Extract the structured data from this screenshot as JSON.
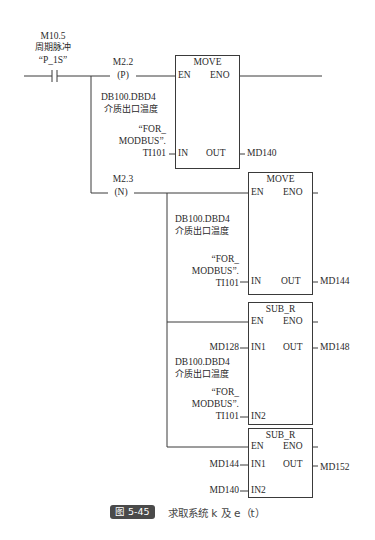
{
  "network": {
    "contact": {
      "address": "M10.5",
      "comment": "周期脉冲",
      "symbol": "“P_1S”",
      "type": "normally-open"
    },
    "coil_p": {
      "address": "M2.2",
      "label": "(P)"
    },
    "coil_n": {
      "address": "M2.3",
      "label": "(N)"
    },
    "move1": {
      "title": "MOVE",
      "en": "EN",
      "eno": "ENO",
      "in": "IN",
      "out": "OUT",
      "in_address": "DB100.DBD4",
      "in_comment": "介质出口温度",
      "in_symbol_1": "“FOR_",
      "in_symbol_2": "MODBUS”.",
      "in_symbol_3": "TI101",
      "out_operand": "MD140"
    },
    "move2": {
      "title": "MOVE",
      "en": "EN",
      "eno": "ENO",
      "in": "IN",
      "out": "OUT",
      "in_address": "DB100.DBD4",
      "in_comment": "介质出口温度",
      "in_symbol_1": "“FOR_",
      "in_symbol_2": "MODBUS”.",
      "in_symbol_3": "TI101",
      "out_operand": "MD144"
    },
    "sub1": {
      "title": "SUB_R",
      "en": "EN",
      "eno": "ENO",
      "in1": "IN1",
      "in2": "IN2",
      "out": "OUT",
      "in1_operand": "MD128",
      "in2_address": "DB100.DBD4",
      "in2_comment": "介质出口温度",
      "in2_symbol_1": "“FOR_",
      "in2_symbol_2": "MODBUS”.",
      "in2_symbol_3": "TI101",
      "out_operand": "MD148"
    },
    "sub2": {
      "title": "SUB_R",
      "en": "EN",
      "eno": "ENO",
      "in1": "IN1",
      "in2": "IN2",
      "out": "OUT",
      "in1_operand": "MD144",
      "in2_operand": "MD140",
      "out_operand": "MD152"
    }
  },
  "caption": {
    "badge": "图 5-45",
    "text": "求取系统 k 及 e（t）"
  }
}
